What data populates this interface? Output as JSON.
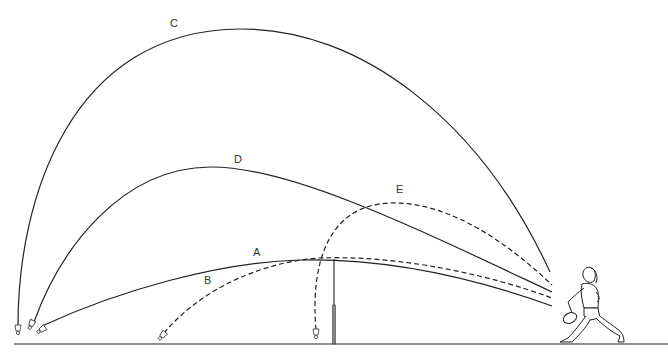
{
  "diagram": {
    "trajectories": [
      {
        "id": "A",
        "label": "A",
        "style": "solid"
      },
      {
        "id": "B",
        "label": "B",
        "style": "dashed"
      },
      {
        "id": "C",
        "label": "C",
        "style": "solid"
      },
      {
        "id": "D",
        "label": "D",
        "style": "solid"
      },
      {
        "id": "E",
        "label": "E",
        "style": "dashed"
      }
    ],
    "elements": {
      "net": "net",
      "player": "player",
      "ground": "court-floor",
      "shuttlecocks": 5
    },
    "colors": {
      "stroke": "#222222",
      "background": "#ffffff"
    }
  }
}
